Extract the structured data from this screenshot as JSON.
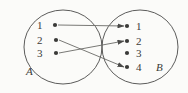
{
  "figure": {
    "type": "mapping-diagram",
    "background_color": "#fbfbf9",
    "stroke_color": "#4a4a48",
    "text_color": "#3a3a38"
  },
  "sets": {
    "left": {
      "name": "A",
      "label": "A",
      "ellipse": {
        "cx": 63,
        "cy": 47,
        "rx": 39,
        "ry": 37
      },
      "elements": [
        {
          "id": "a1",
          "label": "1",
          "label_x": 37,
          "label_y": 20,
          "dot_x": 55,
          "dot_y": 25
        },
        {
          "id": "a2",
          "label": "2",
          "label_x": 37,
          "label_y": 35,
          "dot_x": 56,
          "dot_y": 40
        },
        {
          "id": "a3",
          "label": "3",
          "label_x": 37,
          "label_y": 48,
          "dot_x": 56,
          "dot_y": 53
        }
      ],
      "set_label_x": 26,
      "set_label_y": 66
    },
    "right": {
      "name": "B",
      "label": "B",
      "ellipse": {
        "cx": 140,
        "cy": 47,
        "rx": 38,
        "ry": 37
      },
      "elements": [
        {
          "id": "b1",
          "label": "1",
          "label_x": 136,
          "label_y": 21,
          "dot_x": 127,
          "dot_y": 26
        },
        {
          "id": "b2",
          "label": "2",
          "label_x": 136,
          "label_y": 36,
          "dot_x": 127,
          "dot_y": 41
        },
        {
          "id": "b3",
          "label": "3",
          "label_x": 136,
          "label_y": 48,
          "dot_x": 127,
          "dot_y": 53
        },
        {
          "id": "b4",
          "label": "4",
          "label_x": 136,
          "label_y": 62,
          "dot_x": 127,
          "dot_y": 67
        }
      ],
      "set_label_x": 156,
      "set_label_y": 62
    }
  },
  "arrows": [
    {
      "id": "arrow-a1-b1",
      "from": "a1",
      "to": "b1",
      "x1": 58,
      "y1": 25,
      "x2": 124,
      "y2": 26
    },
    {
      "id": "arrow-a2-b4",
      "from": "a2",
      "to": "b4",
      "x1": 59,
      "y1": 40,
      "x2": 124,
      "y2": 67
    },
    {
      "id": "arrow-a3-b2",
      "from": "a3",
      "to": "b2",
      "x1": 59,
      "y1": 53,
      "x2": 124,
      "y2": 41
    }
  ],
  "unmapped_targets": [
    "b3"
  ]
}
